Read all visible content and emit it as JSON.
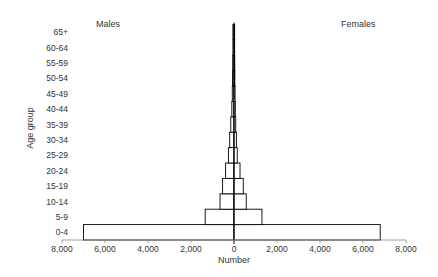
{
  "chart_data": {
    "type": "bar",
    "subtype": "population-pyramid",
    "title": "",
    "xlabel": "Number",
    "ylabel": "Age group",
    "categories": [
      "0-4",
      "5-9",
      "10-14",
      "15-19",
      "20-24",
      "25-29",
      "30-34",
      "35-39",
      "40-44",
      "45-49",
      "50-54",
      "55-59",
      "60-64",
      "65+"
    ],
    "series": [
      {
        "name": "Males",
        "side": "left",
        "values": [
          7000,
          1340,
          650,
          530,
          390,
          260,
          200,
          150,
          100,
          80,
          70,
          60,
          50,
          50
        ]
      },
      {
        "name": "Females",
        "side": "right",
        "values": [
          6800,
          1300,
          570,
          430,
          280,
          150,
          110,
          80,
          60,
          50,
          40,
          35,
          30,
          30
        ]
      }
    ],
    "xlim": [
      -8000,
      8000
    ],
    "x_ticks": [
      -8000,
      -6000,
      -4000,
      -2000,
      0,
      2000,
      4000,
      6000,
      8000
    ],
    "x_tick_labels": [
      "8,000",
      "6,000",
      "4,000",
      "2,000",
      "0",
      "2,000",
      "4,000",
      "6,000",
      "8,000"
    ],
    "grid": false,
    "legend": {
      "position": "top-inside",
      "left_label": "Males",
      "right_label": "Females"
    },
    "colors": {
      "bar_fill": "#ffffff",
      "bar_stroke": "#000000",
      "axis": "#888888"
    }
  },
  "labels": {
    "males": "Males",
    "females": "Females",
    "xlabel": "Number",
    "ylabel": "Age group"
  }
}
